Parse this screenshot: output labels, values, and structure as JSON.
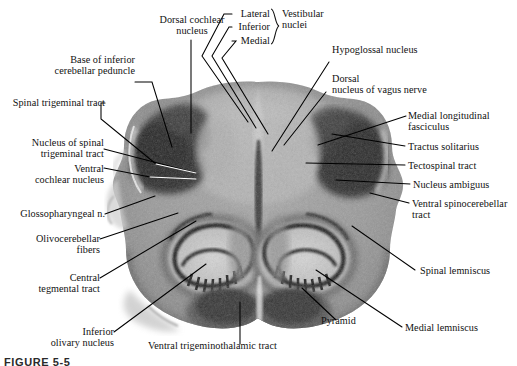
{
  "figure": {
    "caption": "FIGURE 5-5",
    "background_color": "#ffffff",
    "ink_color": "#111111",
    "specimen_description": "Butterfly-shaped transverse section of the caudal medulla oblongata showing paired inferior olivary nuclei, pyramids, and dorsolateral tracts.",
    "leader_line_color": "#000000",
    "white_leader_color": "#ffffff"
  },
  "labels": {
    "dorsal_cochlear_nucleus": "Dorsal cochlear\nnucleus",
    "base_inferior_cerebellar_peduncle": "Base of inferior\ncerebellar peduncle",
    "spinal_trigeminal_tract": "Spinal trigeminal tract",
    "nucleus_spinal_trigeminal_tract": "Nucleus of spinal\ntrigeminal tract",
    "ventral_cochlear_nucleus": "Ventral\ncochlear nucleus",
    "glossopharyngeal_n": "Glossopharyngeal n.",
    "olivocerebellar_fibers": "Olivocerebellar\nfibers",
    "central_tegmental_tract": "Central\ntegmental tract",
    "inferior_olivary_nucleus": "Inferior\nolivary nucleus",
    "ventral_trigeminothalamic_tract": "Ventral trigeminothalamic tract",
    "pyramid": "Pyramid",
    "medial_lemniscus": "Medial lemniscus",
    "spinal_lemniscus": "Spinal lemniscus",
    "ventral_spinocerebellar_tract": "Ventral spinocerebellar\ntract",
    "nucleus_ambiguus": "Nucleus ambiguus",
    "tectospinal_tract": "Tectospinal tract",
    "tractus_solitarius": "Tractus solitarius",
    "medial_longitudinal_fasciculus": "Medial longitudinal\nfasciculus",
    "dorsal_nucleus_vagus_nerve": "Dorsal\nnucleus of vagus nerve",
    "hypoglossal_nucleus": "Hypoglossal nucleus",
    "vestibular_lateral": "Lateral",
    "vestibular_inferior": "Inferior",
    "vestibular_medial": "Medial",
    "vestibular_nuclei_group": "Vestibular\nnuclei"
  }
}
